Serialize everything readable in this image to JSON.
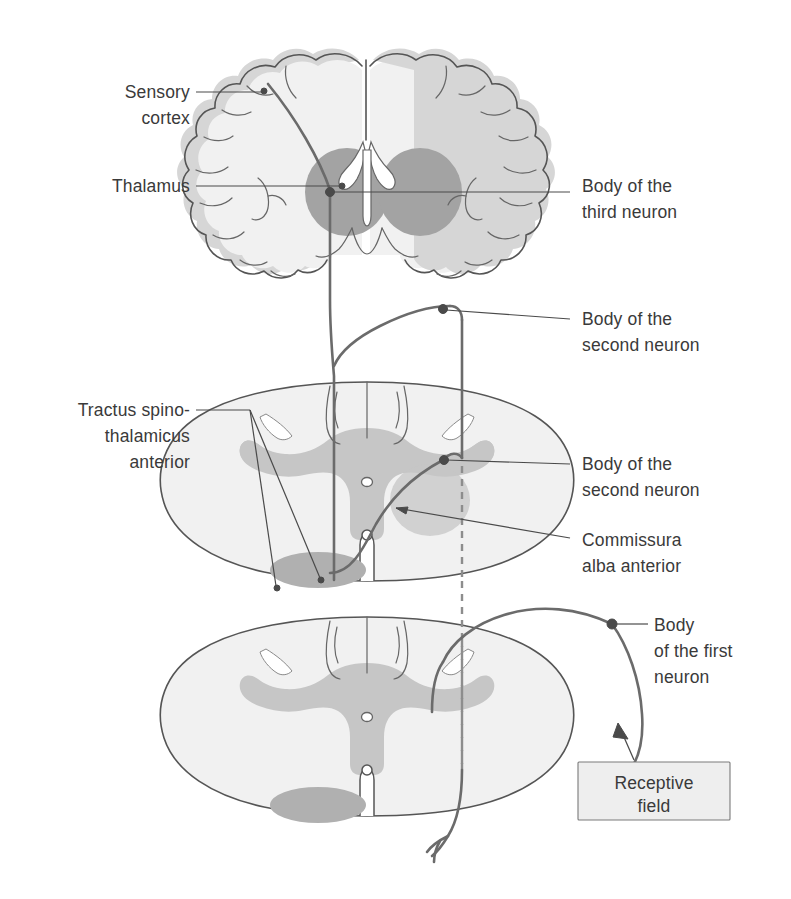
{
  "figure": {
    "colors": {
      "white_matter": "#f0f0f0",
      "gray_matter": "#c6c6c6",
      "gray_matter_dark": "#b4b4b4",
      "cortex_band": "#d8d8d8",
      "thalamus": "#a3a3a3",
      "ventricle": "#ffffff",
      "outline": "#555555",
      "nerve": "#6b6b6b",
      "text": "#3a3a3a",
      "box_fill": "#eeeeee",
      "background": "#ffffff"
    }
  },
  "labels": {
    "sensory_cortex": {
      "line1": "Sensory",
      "line2": "cortex"
    },
    "thalamus": {
      "line1": "Thalamus"
    },
    "third_neuron": {
      "line1": "Body of the",
      "line2": "third neuron"
    },
    "second_neuron_upper": {
      "line1": "Body of the",
      "line2": "second neuron"
    },
    "tractus": {
      "line1": "Tractus spino-",
      "line2": "thalamicus",
      "line3": "anterior"
    },
    "second_neuron_lower": {
      "line1": "Body of the",
      "line2": "second neuron"
    },
    "commissura": {
      "line1": "Commissura",
      "line2": "alba anterior"
    },
    "first_neuron": {
      "line1": "Body",
      "line2": "of the first",
      "line3": "neuron"
    },
    "receptive_field": {
      "line1": "Receptive",
      "line2": "field"
    }
  },
  "structures": {
    "brain_section": "coronal-brain-section",
    "spinal_cord_upper": "spinal-cord-cross-section-upper",
    "spinal_cord_lower": "spinal-cord-cross-section-lower"
  }
}
